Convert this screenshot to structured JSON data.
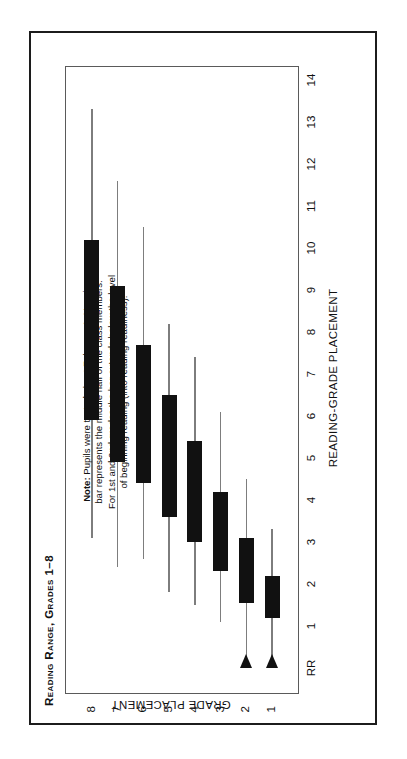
{
  "figure": {
    "title": "Reading Range, Grades 1–8",
    "note_label": "Note:",
    "note_text": " Pupils were tested about February 1. Heavier bar represents the middle half of the class members. For 1st and 2nd grades the bar extends below the level of beginning reading (into reading readiness).",
    "ink_color": "#111111",
    "whisker_color": "#7d7d7d",
    "frame_color": "#1c1c1c"
  },
  "chart_data": {
    "type": "bar",
    "orientation": "horizontal-floating-bar",
    "title": "Reading Range, Grades 1–8",
    "xlabel": "READING-GRADE PLACEMENT",
    "ylabel": "GRADE PLACEMENT",
    "xlim": [
      0,
      14
    ],
    "xticks": [
      0,
      1,
      2,
      3,
      4,
      5,
      6,
      7,
      8,
      9,
      10,
      11,
      12,
      13,
      14
    ],
    "xtick_labels": [
      "RR",
      "1",
      "2",
      "3",
      "4",
      "5",
      "6",
      "7",
      "8",
      "9",
      "10",
      "11",
      "12",
      "13",
      "14"
    ],
    "categories": [
      "8",
      "7",
      "6",
      "5",
      "4",
      "3",
      "2",
      "1"
    ],
    "ytick_labels": [
      "8",
      "7",
      "6",
      "5",
      "4",
      "3",
      "2",
      "1"
    ],
    "grid": false,
    "legend": null,
    "value_note": "Thin line = full range of class; heavy bar = middle half of class members.",
    "series": [
      {
        "name": "range-low",
        "values": [
          3.1,
          2.4,
          2.6,
          1.8,
          1.5,
          1.1,
          0.0,
          0.0
        ]
      },
      {
        "name": "box-low",
        "values": [
          5.9,
          4.9,
          4.4,
          3.6,
          3.0,
          2.3,
          1.55,
          1.2
        ]
      },
      {
        "name": "box-high",
        "values": [
          10.2,
          9.1,
          7.7,
          6.5,
          5.4,
          4.2,
          3.1,
          2.2
        ]
      },
      {
        "name": "range-high",
        "values": [
          13.3,
          11.6,
          10.5,
          8.2,
          7.4,
          6.1,
          4.5,
          3.3
        ]
      }
    ],
    "points": [
      {
        "grade": "8",
        "range_low": 3.1,
        "box_low": 5.9,
        "box_high": 10.2,
        "range_high": 13.3,
        "extends_to_rr": false
      },
      {
        "grade": "7",
        "range_low": 2.4,
        "box_low": 4.9,
        "box_high": 9.1,
        "range_high": 11.6,
        "extends_to_rr": false
      },
      {
        "grade": "6",
        "range_low": 2.6,
        "box_low": 4.4,
        "box_high": 7.7,
        "range_high": 10.5,
        "extends_to_rr": false
      },
      {
        "grade": "5",
        "range_low": 1.8,
        "box_low": 3.6,
        "box_high": 6.5,
        "range_high": 8.2,
        "extends_to_rr": false
      },
      {
        "grade": "4",
        "range_low": 1.5,
        "box_low": 3.0,
        "box_high": 5.4,
        "range_high": 7.4,
        "extends_to_rr": false
      },
      {
        "grade": "3",
        "range_low": 1.1,
        "box_low": 2.3,
        "box_high": 4.2,
        "range_high": 6.1,
        "extends_to_rr": false
      },
      {
        "grade": "2",
        "range_low": 0.0,
        "box_low": 1.55,
        "box_high": 3.1,
        "range_high": 4.5,
        "extends_to_rr": true
      },
      {
        "grade": "1",
        "range_low": 0.0,
        "box_low": 1.2,
        "box_high": 2.2,
        "range_high": 3.3,
        "extends_to_rr": true
      }
    ]
  }
}
